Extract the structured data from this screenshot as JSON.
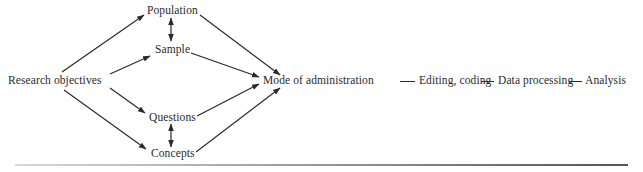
{
  "diagram": {
    "type": "flowchart",
    "nodes": {
      "research_objectives": "Research objectives",
      "population": "Population",
      "sample": "Sample",
      "questions": "Questions",
      "concepts": "Concepts",
      "mode_of_administration": "Mode of administration",
      "editing_coding": "Editing, coding",
      "data_processing": "Data processing",
      "analysis": "Analysis"
    },
    "edges": [
      {
        "from": "Research objectives",
        "to": "Population",
        "style": "arrow"
      },
      {
        "from": "Research objectives",
        "to": "Sample",
        "style": "arrow"
      },
      {
        "from": "Research objectives",
        "to": "Questions",
        "style": "arrow"
      },
      {
        "from": "Research objectives",
        "to": "Concepts",
        "style": "arrow"
      },
      {
        "from": "Population",
        "to": "Sample",
        "style": "double-arrow"
      },
      {
        "from": "Questions",
        "to": "Concepts",
        "style": "double-arrow"
      },
      {
        "from": "Population",
        "to": "Mode of administration",
        "style": "arrow"
      },
      {
        "from": "Sample",
        "to": "Mode of administration",
        "style": "arrow"
      },
      {
        "from": "Questions",
        "to": "Mode of administration",
        "style": "arrow"
      },
      {
        "from": "Concepts",
        "to": "Mode of administration",
        "style": "arrow"
      },
      {
        "from": "Mode of administration",
        "to": "Editing, coding",
        "style": "line"
      },
      {
        "from": "Editing, coding",
        "to": "Data processing",
        "style": "line"
      },
      {
        "from": "Data processing",
        "to": "Analysis",
        "style": "line"
      }
    ],
    "colors": {
      "ink": "#2a2a2a",
      "background": "#ffffff"
    }
  }
}
